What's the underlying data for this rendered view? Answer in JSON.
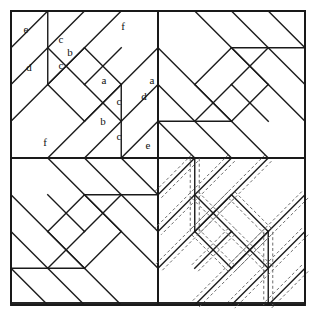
{
  "figure": {
    "type": "geometric-line-diagram",
    "canvas": {
      "width": 318,
      "height": 320
    },
    "frame": {
      "x": 11,
      "y": 11,
      "width": 294,
      "height": 292
    },
    "center": {
      "x": 158,
      "y": 157
    },
    "colors": {
      "background": "#ffffff",
      "solid_line": "#1a1a1a",
      "dashed_line": "#6b6b6b",
      "label_text": "#111111"
    },
    "stroke": {
      "solid_width": 1.4,
      "frame_width": 1.9,
      "dashed_width": 1.0,
      "dash_pattern": "3,2.4"
    }
  },
  "structure": {
    "grid": "2x2 quadrants",
    "quadrant_size": 147,
    "quadrants": [
      {
        "name": "upper-left",
        "rotation_deg": 0,
        "dashed_overlay": false,
        "labeled": true
      },
      {
        "name": "upper-right",
        "rotation_deg": 90,
        "dashed_overlay": false,
        "labeled": false
      },
      {
        "name": "lower-left",
        "rotation_deg": 270,
        "dashed_overlay": false,
        "labeled": false
      },
      {
        "name": "lower-right",
        "rotation_deg": 180,
        "dashed_overlay": true,
        "labeled": false
      }
    ],
    "dashed_offset": 4.5,
    "notes": "Lower-right quadrant repeats the same piecing lines with parallel dashed seam-allowance outlines."
  },
  "patch_labels": [
    {
      "id": "e",
      "text": "e",
      "x": 26,
      "y": 30
    },
    {
      "id": "c1",
      "text": "c",
      "x": 61,
      "y": 40
    },
    {
      "id": "b1",
      "text": "b",
      "x": 70,
      "y": 53
    },
    {
      "id": "f1",
      "text": "f",
      "x": 123,
      "y": 27
    },
    {
      "id": "d1",
      "text": "d",
      "x": 29,
      "y": 68
    },
    {
      "id": "c2",
      "text": "c",
      "x": 61,
      "y": 66
    },
    {
      "id": "a1",
      "text": "a",
      "x": 104,
      "y": 81
    },
    {
      "id": "a2",
      "text": "a",
      "x": 152,
      "y": 81
    },
    {
      "id": "c3",
      "text": "c",
      "x": 119,
      "y": 102
    },
    {
      "id": "d2",
      "text": "d",
      "x": 144,
      "y": 97
    },
    {
      "id": "b2",
      "text": "b",
      "x": 103,
      "y": 122
    },
    {
      "id": "c4",
      "text": "c",
      "x": 119,
      "y": 137
    },
    {
      "id": "f2",
      "text": "f",
      "x": 45,
      "y": 143
    },
    {
      "id": "e2",
      "text": "e",
      "x": 148,
      "y": 146
    }
  ],
  "quadrant_geometry": {
    "unit": 147,
    "description": "Coordinates in a 0..147 local square; (0,0) at the quadrant's outer corner.",
    "solid_paths": [
      "M 0 0 L 147 0 L 147 147 L 0 147 Z",
      "M 0 36.75 L 36.75 0",
      "M 0 110.25 L 110.25 0",
      "M 36.75 147 L 147 36.75",
      "M 110.25 147 L 147 110.25",
      "M 0 73.5 L 73.5 0",
      "M 73.5 147 L 147 73.5",
      "M 36.75 0 L 36.75 73.5",
      "M 110.25 73.5 L 110.25 147",
      "M 36.75 36.75 L 73.5 73.5",
      "M 36.75 73.5 L 73.5 36.75",
      "M 73.5 36.75 L 110.25 73.5",
      "M 73.5 73.5 L 110.25 36.75",
      "M 36.75 73.5 L 73.5 110.25",
      "M 73.5 110.25 L 110.25 73.5",
      "M 73.5 73.5 L 110.25 110.25"
    ]
  },
  "legend_note": {
    "solid": "piece outline / stitching line",
    "dashed": "seam allowance"
  }
}
